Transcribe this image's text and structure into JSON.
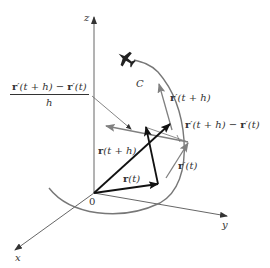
{
  "diagram": {
    "axes": {
      "x_label": "x",
      "y_label": "y",
      "z_label": "z",
      "origin_label": "0"
    },
    "curve": {
      "label": "C",
      "color": "#777777"
    },
    "vectors": {
      "r_t": {
        "label_bold": "r",
        "label_rest": "(t)"
      },
      "r_t_plus_h": {
        "label_bold": "r",
        "label_rest": "(t + h)"
      },
      "r_prime_t": {
        "label_bold": "r",
        "label_rest": "′(t)"
      },
      "r_prime_t_plus_h": {
        "label_bold": "r",
        "label_rest": "′(t + h)"
      },
      "difference": {
        "label_bold_1": "r",
        "label_rest_1": "′(t + h) − ",
        "label_bold_2": "r",
        "label_rest_2": "′(t)"
      },
      "difference_quotient": {
        "numerator_bold_1": "r",
        "numerator_rest_1": "′(t + h) − ",
        "numerator_bold_2": "r",
        "numerator_rest_2": "′(t)",
        "denominator": "h"
      }
    },
    "icons": {
      "airplane": "airplane-icon"
    },
    "colors": {
      "dark_vector": "#111111",
      "gray_vector": "#808080",
      "axis": "#555555",
      "text": "#333333"
    }
  }
}
